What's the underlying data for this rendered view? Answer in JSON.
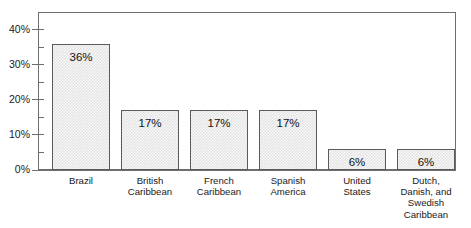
{
  "chart_data": {
    "type": "bar",
    "title": "",
    "subtitle": "",
    "xlabel": "",
    "ylabel": "",
    "categories": [
      "Brazil",
      "British\nCaribbean",
      "French\nCaribbean",
      "Spanish\nAmerica",
      "United\nStates",
      "Dutch,\nDanish, and\nSwedish\nCaribbean"
    ],
    "values": [
      36,
      17,
      17,
      17,
      6,
      6
    ],
    "value_labels": [
      "36%",
      "17%",
      "17%",
      "17%",
      "6%",
      "6%"
    ],
    "ylim": [
      0,
      45
    ],
    "ytick_labels": [
      "0%",
      "10%",
      "20%",
      "30%",
      "40%"
    ],
    "ytick_values": [
      0,
      10,
      20,
      30,
      40
    ],
    "yminor_values": [
      5,
      15,
      25,
      35,
      45
    ],
    "grid": false,
    "legend": null,
    "legend_position": "none",
    "series": [
      {
        "name": "Share",
        "values": [
          36,
          17,
          17,
          17,
          6,
          6
        ]
      }
    ]
  },
  "style": {
    "bar_fill": "#e4e4e4",
    "bar_border": "#5a5a5a",
    "axis_color": "#6e6e6e",
    "text_color": "#1a1a1a",
    "background": "#ffffff"
  }
}
